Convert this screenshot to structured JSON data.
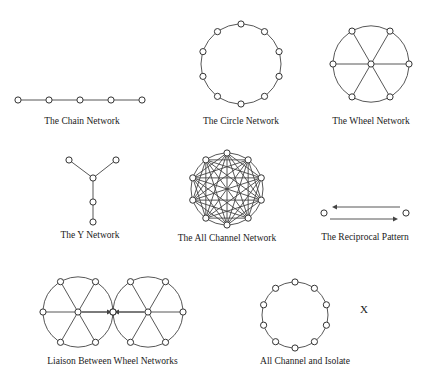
{
  "figure": {
    "node_radius": 3.1,
    "node_fill": "#ffffff",
    "node_stroke": "#333333",
    "node_stroke_width": 1.0,
    "edge_stroke": "#444444",
    "edge_stroke_width": 0.9,
    "background": "#ffffff",
    "text_color": "#1a1a1a"
  },
  "panels": [
    {
      "id": "chain-network",
      "caption": "The Chain Network",
      "type": "chain",
      "node_count": 5,
      "x": 2,
      "y": 58,
      "width": 160,
      "height": 68,
      "view": {
        "w": 160,
        "h": 50
      },
      "nodes": [
        {
          "cx": 16,
          "cy": 36
        },
        {
          "cx": 47,
          "cy": 36
        },
        {
          "cx": 78,
          "cy": 36
        },
        {
          "cx": 109,
          "cy": 36
        },
        {
          "cx": 140,
          "cy": 36
        }
      ],
      "edges": [
        [
          0,
          1
        ],
        [
          1,
          2
        ],
        [
          2,
          3
        ],
        [
          3,
          4
        ]
      ]
    },
    {
      "id": "circle-network",
      "caption": "The Circle Network",
      "type": "ring",
      "node_count": 10,
      "x": 181,
      "y": 10,
      "width": 120,
      "height": 116,
      "view": {
        "w": 120,
        "h": 100
      },
      "ring": {
        "cx": 60,
        "cy": 50,
        "r": 40,
        "start_angle": -90
      },
      "chords": false
    },
    {
      "id": "wheel-network",
      "caption": "The Wheel Network",
      "type": "wheel",
      "rim_count": 6,
      "x": 312,
      "y": 10,
      "width": 118,
      "height": 116,
      "view": {
        "w": 118,
        "h": 100
      },
      "ring": {
        "cx": 59,
        "cy": 50,
        "r": 38,
        "start_angle": -60
      },
      "hub": {
        "cx": 59,
        "cy": 50
      }
    },
    {
      "id": "y-network",
      "caption": "The Y Network",
      "type": "tree",
      "node_count": 5,
      "x": 20,
      "y": 140,
      "width": 140,
      "height": 100,
      "view": {
        "w": 140,
        "h": 82
      },
      "nodes": [
        {
          "cx": 49,
          "cy": 14
        },
        {
          "cx": 96,
          "cy": 14
        },
        {
          "cx": 73,
          "cy": 32
        },
        {
          "cx": 73,
          "cy": 56
        },
        {
          "cx": 73,
          "cy": 76
        }
      ],
      "edges": [
        [
          0,
          2
        ],
        [
          1,
          2
        ],
        [
          2,
          3
        ],
        [
          3,
          4
        ]
      ]
    },
    {
      "id": "all-channel-network",
      "caption": "The All Channel Network",
      "type": "complete",
      "node_count": 10,
      "x": 163,
      "y": 143,
      "width": 128,
      "height": 100,
      "view": {
        "w": 128,
        "h": 84
      },
      "ring": {
        "cx": 64,
        "cy": 42,
        "r": 36,
        "start_angle": -90
      },
      "chords": true
    },
    {
      "id": "reciprocal-pattern",
      "caption": "The Reciprocal Pattern",
      "type": "reciprocal",
      "node_count": 2,
      "x": 300,
      "y": 190,
      "width": 130,
      "height": 52,
      "view": {
        "w": 130,
        "h": 34
      },
      "nodes": [
        {
          "cx": 24,
          "cy": 17
        },
        {
          "cx": 106,
          "cy": 17
        }
      ],
      "arrows": [
        {
          "x1": 100,
          "y1": 11,
          "x2": 32,
          "y2": 11,
          "direction": "left"
        },
        {
          "x1": 30,
          "y1": 23,
          "x2": 98,
          "y2": 23,
          "direction": "right"
        }
      ]
    },
    {
      "id": "liaison-between-wheel-networks",
      "caption": "Liaison Between Wheel Networks",
      "type": "dual-wheel",
      "rim_count": 6,
      "x": 20,
      "y": 268,
      "width": 185,
      "height": 98,
      "view": {
        "w": 185,
        "h": 82
      },
      "wheels": [
        {
          "cx": 58,
          "cy": 40,
          "r": 35,
          "start_angle": -60
        },
        {
          "cx": 128,
          "cy": 40,
          "r": 35,
          "start_angle": -60
        }
      ],
      "liaison": {
        "x1": 58,
        "y1": 40,
        "x2": 128,
        "y2": 40,
        "node_cx": 93,
        "node_cy": 40
      }
    },
    {
      "id": "all-channel-and-isolate",
      "caption": "All Channel and Isolate",
      "type": "ring",
      "node_count": 10,
      "x": 245,
      "y": 272,
      "width": 120,
      "height": 94,
      "view": {
        "w": 120,
        "h": 78
      },
      "ring": {
        "cx": 50,
        "cy": 39,
        "r": 33,
        "start_angle": -90
      },
      "chords": false
    }
  ],
  "isolate": {
    "label": "X",
    "x": 360,
    "y": 303
  }
}
